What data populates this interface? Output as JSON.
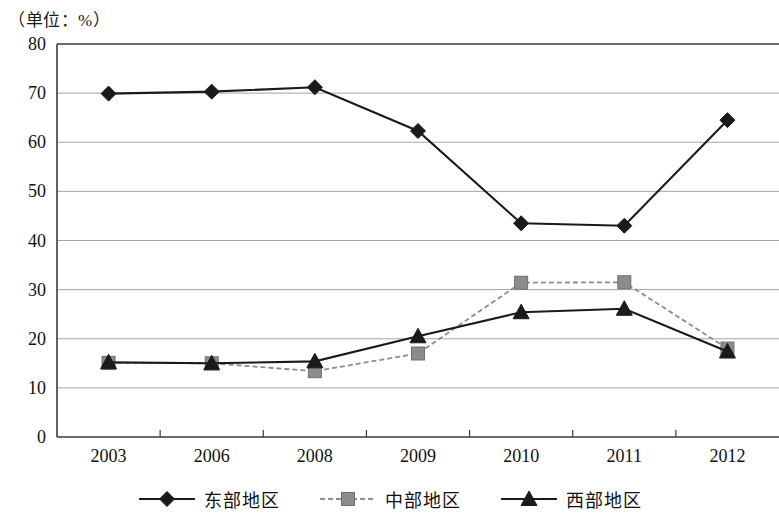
{
  "unit_note": "（单位：%）",
  "chart_data": {
    "type": "line",
    "title": "",
    "subtitle": "",
    "xlabel": "",
    "ylabel": "",
    "unit": "%",
    "unit_note": "（单位：%）",
    "categories": [
      "2003",
      "2006",
      "2008",
      "2009",
      "2010",
      "2011",
      "2012"
    ],
    "ylim": [
      0,
      80
    ],
    "ytick_values": [
      0,
      10,
      20,
      30,
      40,
      50,
      60,
      70,
      80
    ],
    "ytick_labels": [
      "0",
      "10",
      "20",
      "30",
      "40",
      "50",
      "60",
      "70",
      "80"
    ],
    "grid": true,
    "legend_position": "bottom",
    "series": [
      {
        "name": "东部地区",
        "marker": "diamond",
        "line_style": "solid",
        "color": "#1a1a1a",
        "values": [
          69.9,
          70.3,
          71.2,
          62.3,
          43.5,
          43.0,
          64.5
        ]
      },
      {
        "name": "中部地区",
        "marker": "square",
        "line_style": "dashed",
        "color": "#8c8c8c",
        "values": [
          15.1,
          15.0,
          13.4,
          17.0,
          31.4,
          31.5,
          18.0
        ]
      },
      {
        "name": "西部地区",
        "marker": "triangle",
        "line_style": "solid",
        "color": "#1a1a1a",
        "values": [
          15.2,
          15.0,
          15.4,
          20.5,
          25.4,
          26.1,
          17.4
        ]
      }
    ]
  }
}
